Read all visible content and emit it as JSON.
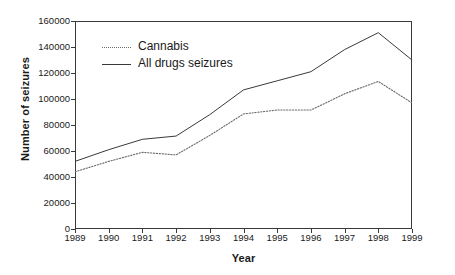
{
  "chart_data": {
    "type": "line",
    "title": "",
    "xlabel": "Year",
    "ylabel": "Number of seizures",
    "categories": [
      "1989",
      "1990",
      "1991",
      "1992",
      "1993",
      "1994",
      "1995",
      "1996",
      "1997",
      "1998",
      "1999"
    ],
    "x": [
      1989,
      1990,
      1991,
      1992,
      1993,
      1994,
      1995,
      1996,
      1997,
      1998,
      1999
    ],
    "series": [
      {
        "name": "Cannabis",
        "style": "dotted",
        "color": "#6a6a6a",
        "values": [
          44000,
          52000,
          59000,
          57000,
          72000,
          88500,
          91500,
          91500,
          104000,
          113500,
          97000
        ]
      },
      {
        "name": "All drugs seizures",
        "style": "solid",
        "color": "#3a3a3a",
        "values": [
          52000,
          61000,
          69000,
          71500,
          88000,
          107000,
          114000,
          121000,
          138000,
          151000,
          130000
        ]
      }
    ],
    "ylim": [
      0,
      160000
    ],
    "yticks": [
      0,
      20000,
      40000,
      60000,
      80000,
      100000,
      120000,
      140000,
      160000
    ],
    "ytick_labels": [
      "0",
      "20000",
      "40000",
      "60000",
      "80000",
      "100000",
      "120000",
      "140000",
      "160000"
    ],
    "xlim": [
      1989,
      1999
    ],
    "grid": false,
    "legend_position": "top-left",
    "legend": [
      "Cannabis",
      "All drugs seizures"
    ]
  },
  "axes": {
    "y_title": "Number of seizures",
    "x_title": "Year"
  },
  "legend": {
    "cannabis_label": "Cannabis",
    "all_drugs_label": "All drugs seizures"
  }
}
